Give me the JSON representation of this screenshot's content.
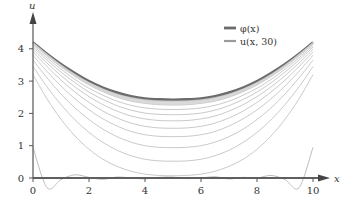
{
  "chart_data": {
    "type": "line",
    "title": "",
    "xlabel": "x",
    "ylabel": "u",
    "xlim": [
      0,
      10.5
    ],
    "ylim": [
      -0.4,
      4.8
    ],
    "x_ticks": [
      "0",
      "2",
      "4",
      "6",
      "8",
      "10"
    ],
    "y_ticks": [
      "0",
      "1",
      "2",
      "3",
      "4"
    ],
    "grid": false,
    "legend_position": "upper right",
    "legend": [
      {
        "label": "φ(x)",
        "color": "#6b6b6b",
        "width": 2.2
      },
      {
        "label": "u(x, 30)",
        "color": "#9a9a9a",
        "width": 1.6
      }
    ],
    "x": [
      0,
      0.5,
      1,
      1.5,
      2,
      2.5,
      3,
      3.5,
      4,
      4.5,
      5,
      5.5,
      6,
      6.5,
      7,
      7.5,
      8,
      8.5,
      9,
      9.5,
      10
    ],
    "series": [
      {
        "name": "φ(x)",
        "values": [
          4.2,
          3.85,
          3.53,
          3.25,
          3.0,
          2.8,
          2.65,
          2.54,
          2.47,
          2.44,
          2.43,
          2.44,
          2.47,
          2.54,
          2.65,
          2.8,
          3.0,
          3.25,
          3.53,
          3.85,
          4.2
        ]
      },
      {
        "name": "u(x, 30)",
        "values": [
          4.2,
          3.84,
          3.51,
          3.22,
          2.97,
          2.77,
          2.61,
          2.5,
          2.43,
          2.4,
          2.39,
          2.4,
          2.43,
          2.5,
          2.61,
          2.77,
          2.97,
          3.22,
          3.51,
          3.84,
          4.2
        ]
      },
      {
        "name": "u(x, t) transient",
        "values": [
          4.15,
          3.78,
          3.44,
          3.14,
          2.88,
          2.67,
          2.5,
          2.38,
          2.31,
          2.27,
          2.26,
          2.27,
          2.31,
          2.38,
          2.5,
          2.67,
          2.88,
          3.14,
          3.44,
          3.78,
          4.15
        ]
      },
      {
        "name": "u(x, t) transient",
        "values": [
          4.1,
          3.72,
          3.37,
          3.05,
          2.78,
          2.56,
          2.38,
          2.25,
          2.17,
          2.13,
          2.12,
          2.13,
          2.17,
          2.25,
          2.38,
          2.56,
          2.78,
          3.05,
          3.37,
          3.72,
          4.1
        ]
      },
      {
        "name": "u(x, t) transient",
        "values": [
          4.05,
          3.65,
          3.28,
          2.95,
          2.66,
          2.43,
          2.24,
          2.1,
          2.01,
          1.97,
          1.96,
          1.97,
          2.01,
          2.1,
          2.24,
          2.43,
          2.66,
          2.95,
          3.28,
          3.65,
          4.05
        ]
      },
      {
        "name": "u(x, t) transient",
        "values": [
          3.98,
          3.56,
          3.17,
          2.82,
          2.52,
          2.27,
          2.07,
          1.92,
          1.83,
          1.78,
          1.77,
          1.78,
          1.83,
          1.92,
          2.07,
          2.27,
          2.52,
          2.82,
          3.17,
          3.56,
          3.98
        ]
      },
      {
        "name": "u(x, t) transient",
        "values": [
          3.9,
          3.45,
          3.03,
          2.66,
          2.34,
          2.07,
          1.86,
          1.7,
          1.6,
          1.55,
          1.54,
          1.55,
          1.6,
          1.7,
          1.86,
          2.07,
          2.34,
          2.66,
          3.03,
          3.45,
          3.9
        ]
      },
      {
        "name": "u(x, t) transient",
        "values": [
          3.8,
          3.3,
          2.85,
          2.45,
          2.11,
          1.83,
          1.61,
          1.44,
          1.34,
          1.29,
          1.28,
          1.29,
          1.34,
          1.44,
          1.61,
          1.83,
          2.11,
          2.45,
          2.85,
          3.3,
          3.8
        ]
      },
      {
        "name": "u(x, t) transient",
        "values": [
          3.65,
          3.1,
          2.6,
          2.17,
          1.81,
          1.51,
          1.28,
          1.11,
          1.0,
          0.95,
          0.94,
          0.95,
          1.0,
          1.11,
          1.28,
          1.51,
          1.81,
          2.17,
          2.6,
          3.1,
          3.65
        ]
      },
      {
        "name": "u(x, t) transient",
        "values": [
          3.45,
          2.82,
          2.27,
          1.8,
          1.41,
          1.1,
          0.86,
          0.69,
          0.58,
          0.53,
          0.52,
          0.53,
          0.58,
          0.69,
          0.86,
          1.1,
          1.41,
          1.8,
          2.27,
          2.82,
          3.45
        ]
      },
      {
        "name": "u(x, t) transient",
        "values": [
          3.2,
          2.45,
          1.82,
          1.3,
          0.89,
          0.58,
          0.36,
          0.21,
          0.12,
          0.08,
          0.07,
          0.08,
          0.12,
          0.21,
          0.36,
          0.58,
          0.89,
          1.3,
          1.82,
          2.45,
          3.2
        ]
      },
      {
        "name": "u(x, 0) initial",
        "values": [
          0.95,
          -0.3,
          -0.05,
          0.1,
          0.02,
          -0.04,
          0.03,
          0.0,
          -0.03,
          0.02,
          0.03,
          -0.02,
          0.0,
          0.04,
          -0.03,
          0.02,
          0.0,
          0.08,
          -0.05,
          -0.3,
          0.95
        ]
      }
    ]
  },
  "axes": {
    "x_label": "x",
    "y_label": "u"
  }
}
